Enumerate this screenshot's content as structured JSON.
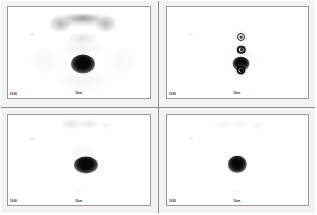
{
  "study": {
    "modality": "nuclear-medicine-scintigraphy",
    "layout": "2x2",
    "background_color": "#f2f2f0",
    "frame_color": "#9a9a9a",
    "image_background": "#ffffff"
  },
  "panels": [
    {
      "id": "panel-top-left",
      "position": "top-left",
      "view_label": "ANT",
      "corner_label": "10:00",
      "scale_marker": "10cm",
      "features": [
        {
          "name": "skull-base-uptake",
          "kind": "diffuse",
          "x": 53,
          "y": 14,
          "w": 46,
          "h": 16,
          "opacity": 0.55
        },
        {
          "name": "salivary-gland-left",
          "kind": "diffuse",
          "x": 37,
          "y": 19,
          "w": 16,
          "h": 17,
          "opacity": 0.7
        },
        {
          "name": "salivary-gland-right",
          "kind": "diffuse",
          "x": 69,
          "y": 19,
          "w": 16,
          "h": 17,
          "opacity": 0.7
        },
        {
          "name": "oral-cavity-uptake",
          "kind": "diffuse",
          "x": 53,
          "y": 12,
          "w": 24,
          "h": 10,
          "opacity": 0.8
        },
        {
          "name": "thyroid-bed-activity",
          "kind": "faint",
          "x": 53,
          "y": 34,
          "w": 20,
          "h": 13,
          "opacity": 0.5
        },
        {
          "name": "neck-soft-tissue",
          "kind": "vfaint",
          "x": 53,
          "y": 46,
          "w": 30,
          "h": 26,
          "opacity": 0.45
        },
        {
          "name": "focal-hot-lesion",
          "kind": "hot",
          "x": 53,
          "y": 63,
          "w": 17,
          "h": 21,
          "opacity": 1.0
        },
        {
          "name": "mediastinum-uptake",
          "kind": "vfaint",
          "x": 53,
          "y": 82,
          "w": 38,
          "h": 24,
          "opacity": 0.4
        },
        {
          "name": "shoulder-left",
          "kind": "vfaint",
          "x": 26,
          "y": 60,
          "w": 22,
          "h": 30,
          "opacity": 0.3
        },
        {
          "name": "shoulder-right",
          "kind": "vfaint",
          "x": 80,
          "y": 60,
          "w": 22,
          "h": 30,
          "opacity": 0.3
        },
        {
          "name": "reference-point-dot",
          "kind": "faint",
          "x": 17,
          "y": 30,
          "w": 4,
          "h": 3,
          "opacity": 0.65
        }
      ],
      "markers": []
    },
    {
      "id": "panel-top-right",
      "position": "top-right",
      "view_label": "ANT",
      "corner_label": "10:00",
      "scale_marker": "10cm",
      "features": [
        {
          "name": "focal-hot-lesion",
          "kind": "hot",
          "x": 53,
          "y": 63,
          "w": 12,
          "h": 16,
          "opacity": 1.0
        },
        {
          "name": "background-activity",
          "kind": "vfaint",
          "x": 53,
          "y": 60,
          "w": 26,
          "h": 30,
          "opacity": 0.22
        },
        {
          "name": "reference-point-dot",
          "kind": "faint",
          "x": 17,
          "y": 30,
          "w": 4,
          "h": 3,
          "opacity": 0.6
        }
      ],
      "markers": [
        {
          "name": "fiducial-marker-1",
          "x": 53,
          "y": 33,
          "size": 8,
          "intensity": "low"
        },
        {
          "name": "fiducial-marker-2",
          "x": 53,
          "y": 47,
          "size": 8.5,
          "intensity": "medium"
        },
        {
          "name": "fiducial-marker-3",
          "x": 53,
          "y": 70,
          "size": 9,
          "intensity": "high"
        }
      ]
    },
    {
      "id": "panel-bottom-left",
      "position": "bottom-left",
      "view_label": "ANT",
      "corner_label": "10:00",
      "scale_marker": "10cm",
      "features": [
        {
          "name": "salivary-gland-left",
          "kind": "faint",
          "x": 45,
          "y": 11,
          "w": 16,
          "h": 11,
          "opacity": 0.55
        },
        {
          "name": "salivary-gland-right",
          "kind": "faint",
          "x": 57,
          "y": 10,
          "w": 14,
          "h": 10,
          "opacity": 0.5
        },
        {
          "name": "submandibular-uptake",
          "kind": "vfaint",
          "x": 69,
          "y": 12,
          "w": 10,
          "h": 8,
          "opacity": 0.45
        },
        {
          "name": "thyroid-region-faint",
          "kind": "vfaint",
          "x": 53,
          "y": 40,
          "w": 18,
          "h": 16,
          "opacity": 0.3
        },
        {
          "name": "focal-hot-lesion",
          "kind": "hot",
          "x": 55,
          "y": 56,
          "w": 17,
          "h": 19,
          "opacity": 1.0
        },
        {
          "name": "sternum-marker",
          "kind": "vfaint",
          "x": 50,
          "y": 84,
          "w": 7,
          "h": 4,
          "opacity": 0.5
        },
        {
          "name": "reference-point-dot",
          "kind": "faint",
          "x": 17,
          "y": 27,
          "w": 4,
          "h": 3,
          "opacity": 0.6
        }
      ],
      "markers": []
    },
    {
      "id": "panel-bottom-right",
      "position": "bottom-right",
      "view_label": "ANT",
      "corner_label": "10:00",
      "scale_marker": "10cm",
      "features": [
        {
          "name": "salivary-gland-left",
          "kind": "vfaint",
          "x": 40,
          "y": 11,
          "w": 13,
          "h": 9,
          "opacity": 0.38
        },
        {
          "name": "salivary-gland-right",
          "kind": "vfaint",
          "x": 53,
          "y": 10,
          "w": 13,
          "h": 9,
          "opacity": 0.42
        },
        {
          "name": "submandibular-uptake",
          "kind": "vfaint",
          "x": 64,
          "y": 12,
          "w": 10,
          "h": 8,
          "opacity": 0.35
        },
        {
          "name": "focal-hot-lesion",
          "kind": "hot",
          "x": 50,
          "y": 55,
          "w": 13,
          "h": 18,
          "opacity": 1.0
        },
        {
          "name": "sternum-marker",
          "kind": "vfaint",
          "x": 50,
          "y": 85,
          "w": 7,
          "h": 4,
          "opacity": 0.5
        },
        {
          "name": "reference-point-dot",
          "kind": "faint",
          "x": 17,
          "y": 26,
          "w": 4,
          "h": 3,
          "opacity": 0.55
        }
      ],
      "markers": []
    }
  ]
}
